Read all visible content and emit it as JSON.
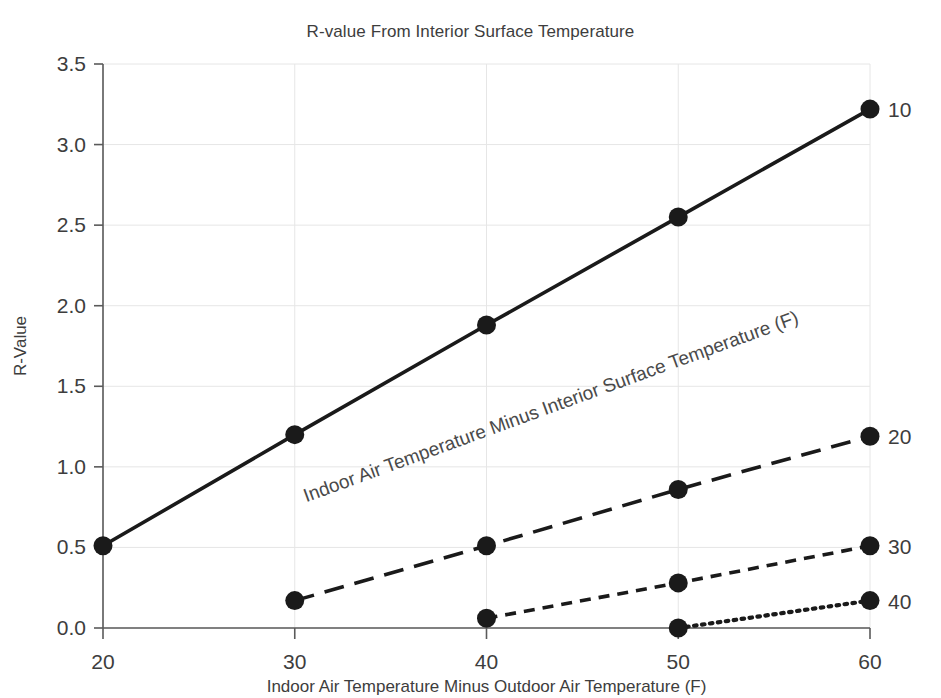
{
  "chart_data": {
    "type": "line",
    "title": "R-value From Interior Surface Temperature",
    "xlabel": "Indoor Air Temperature Minus Outdoor Air Temperature (F)",
    "ylabel": "R-Value",
    "xlim": [
      20,
      60
    ],
    "ylim": [
      0.0,
      3.5
    ],
    "xticks": [
      20,
      30,
      40,
      50,
      60
    ],
    "xtick_labels": [
      "20",
      "30",
      "40",
      "50",
      "60"
    ],
    "yticks": [
      0.0,
      0.5,
      1.0,
      1.5,
      2.0,
      2.5,
      3.0,
      3.5
    ],
    "ytick_labels": [
      "0.0",
      "0.5",
      "1.0",
      "1.5",
      "2.0",
      "2.5",
      "3.0",
      "3.5"
    ],
    "grid": true,
    "grid_color": "#e6e6e6",
    "legend_position": "right-end-of-line",
    "line_color": "#1a1a1a",
    "marker": "circle",
    "annotations": [
      {
        "text": "Indoor Air Temperature Minus Interior Surface Temperature (F)",
        "rotation_deg": -20,
        "anchor_x": 30.6,
        "anchor_y": 0.78
      }
    ],
    "series": [
      {
        "name": "10",
        "label": "10",
        "style": "solid",
        "x": [
          20,
          30,
          40,
          50,
          60
        ],
        "values": [
          0.51,
          1.2,
          1.88,
          2.55,
          3.22
        ]
      },
      {
        "name": "20",
        "label": "20",
        "style": "long-dash",
        "x": [
          30,
          40,
          50,
          60
        ],
        "values": [
          0.17,
          0.51,
          0.86,
          1.19
        ]
      },
      {
        "name": "30",
        "label": "30",
        "style": "short-dash",
        "x": [
          40,
          50,
          60
        ],
        "values": [
          0.06,
          0.28,
          0.51
        ]
      },
      {
        "name": "40",
        "label": "40",
        "style": "dotted",
        "x": [
          50,
          60
        ],
        "values": [
          0.0,
          0.17
        ]
      }
    ]
  }
}
